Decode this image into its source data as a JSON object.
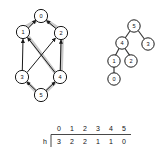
{
  "figure": {
    "title": "",
    "graph": {
      "name": "directed-graph",
      "nodes": [
        {
          "id": "0",
          "label": "0",
          "cx": 41,
          "cy": 16,
          "r": 6.6
        },
        {
          "id": "1",
          "label": "1",
          "cx": 23,
          "cy": 32,
          "r": 6.6
        },
        {
          "id": "2",
          "label": "2",
          "cx": 61,
          "cy": 33,
          "r": 6.6
        },
        {
          "id": "3",
          "label": "3",
          "cx": 22,
          "cy": 77,
          "r": 6.6
        },
        {
          "id": "4",
          "label": "4",
          "cx": 60,
          "cy": 77,
          "r": 6.6
        },
        {
          "id": "5",
          "label": "5",
          "cx": 41,
          "cy": 95,
          "r": 6.6
        }
      ],
      "edges": [
        {
          "from": "1",
          "to": "0"
        },
        {
          "from": "2",
          "to": "0"
        },
        {
          "from": "3",
          "to": "1"
        },
        {
          "from": "4",
          "to": "2"
        },
        {
          "from": "3",
          "to": "2"
        },
        {
          "from": "4",
          "to": "1"
        },
        {
          "from": "5",
          "to": "3"
        },
        {
          "from": "5",
          "to": "4"
        }
      ],
      "highlighted_edges": [
        {
          "from": "1",
          "to": "0"
        },
        {
          "from": "2",
          "to": "0"
        },
        {
          "from": "4",
          "to": "2"
        },
        {
          "from": "4",
          "to": "1"
        },
        {
          "from": "5",
          "to": "4"
        },
        {
          "from": "5",
          "to": "3"
        }
      ]
    },
    "tree": {
      "name": "height-tree",
      "nodes": [
        {
          "id": "5",
          "label": "5",
          "cx": 134,
          "cy": 26,
          "r": 6.2
        },
        {
          "id": "4",
          "label": "4",
          "cx": 122,
          "cy": 43,
          "r": 6.2
        },
        {
          "id": "3",
          "label": "3",
          "cx": 148,
          "cy": 44,
          "r": 6.2
        },
        {
          "id": "1",
          "label": "1",
          "cx": 114,
          "cy": 61,
          "r": 6.2
        },
        {
          "id": "2",
          "label": "2",
          "cx": 131,
          "cy": 61,
          "r": 6.2
        },
        {
          "id": "0",
          "label": "0",
          "cx": 114,
          "cy": 79,
          "r": 6.2
        }
      ],
      "edges": [
        {
          "from": "5",
          "to": "4"
        },
        {
          "from": "5",
          "to": "3"
        },
        {
          "from": "4",
          "to": "1"
        },
        {
          "from": "4",
          "to": "2"
        },
        {
          "from": "1",
          "to": "0"
        }
      ]
    },
    "table": {
      "name": "height-table",
      "row_label": "h",
      "headers": [
        "0",
        "1",
        "2",
        "3",
        "4",
        "5"
      ],
      "values": [
        "3",
        "2",
        "2",
        "1",
        "1",
        "0"
      ]
    }
  },
  "colors": {
    "node_fill": "#ffffff",
    "node_stroke": "#1a1a1a",
    "edge": "#1a1a1a",
    "highlight": "#c9c9c9",
    "text": "#111111",
    "background": "#ffffff"
  }
}
